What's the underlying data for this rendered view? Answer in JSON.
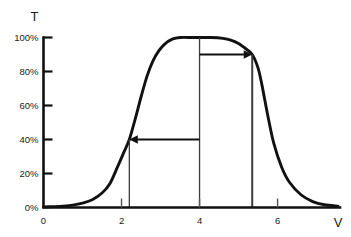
{
  "chart_data": {
    "type": "line",
    "title": "",
    "subtitle": "",
    "xlabel": "V",
    "ylabel": "T",
    "xlim": [
      0,
      7.6
    ],
    "ylim": [
      0,
      100
    ],
    "grid": false,
    "legend_position": "none",
    "x_ticks": [
      {
        "value": 0,
        "label": "0"
      },
      {
        "value": 2,
        "label": "2"
      },
      {
        "value": 4,
        "label": "4"
      },
      {
        "value": 6,
        "label": "6"
      }
    ],
    "y_ticks": [
      {
        "value": 0,
        "label": "0%"
      },
      {
        "value": 20,
        "label": "20%"
      },
      {
        "value": 40,
        "label": "40%"
      },
      {
        "value": 60,
        "label": "60%"
      },
      {
        "value": 80,
        "label": "80%"
      },
      {
        "value": 100,
        "label": "100%"
      }
    ],
    "series": [
      {
        "name": "transmittance",
        "color": "#111111",
        "x": [
          0.0,
          0.25,
          0.5,
          0.75,
          1.0,
          1.25,
          1.5,
          1.7,
          1.9,
          2.05,
          2.2,
          2.35,
          2.5,
          2.65,
          2.8,
          2.95,
          3.1,
          3.3,
          3.5,
          3.8,
          4.0,
          4.3,
          4.6,
          4.8,
          5.0,
          5.15,
          5.35,
          5.5,
          5.6,
          5.75,
          5.9,
          6.1,
          6.3,
          6.6,
          6.9,
          7.2,
          7.55
        ],
        "values": [
          0.3,
          0.5,
          0.8,
          1.4,
          2.6,
          4.6,
          8.5,
          14.0,
          24.0,
          32.0,
          40.0,
          52.0,
          65.0,
          77.0,
          86.0,
          92.0,
          96.0,
          99.0,
          100.0,
          100.0,
          100.0,
          100.0,
          99.5,
          98.5,
          96.5,
          94.0,
          90.0,
          82.0,
          72.0,
          54.0,
          38.0,
          24.0,
          15.0,
          7.5,
          3.5,
          1.6,
          0.8
        ]
      }
    ],
    "reference_lines": [
      {
        "name": "threshold-voltage-line",
        "x": 2.2,
        "y_from": 0,
        "y_to": 40
      },
      {
        "name": "mid-voltage-line",
        "x": 4.0,
        "y_from": 0,
        "y_to": 100
      },
      {
        "name": "saturation-voltage-line",
        "x": 5.35,
        "y_from": 0,
        "y_to": 90
      }
    ],
    "annotations": [
      {
        "name": "left-arrow",
        "label": "",
        "y": 40,
        "x_from": 4.0,
        "x_to": 2.2,
        "direction": "left"
      },
      {
        "name": "right-arrow",
        "label": "",
        "y": 90,
        "x_from": 4.0,
        "x_to": 5.35,
        "direction": "right"
      }
    ]
  }
}
